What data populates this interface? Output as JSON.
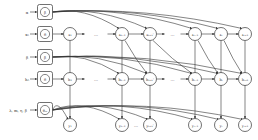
{
  "diagram": {
    "type": "graphical-model",
    "colors": {
      "stroke": "#333333",
      "background": "#ffffff",
      "text": "#333333"
    },
    "inputs": [
      {
        "id": "alpha",
        "label": "α",
        "node_label": "β",
        "y": 12
      },
      {
        "id": "x0",
        "label": "x₀",
        "node_label": "δ",
        "y": 34
      },
      {
        "id": "beta",
        "label": "β",
        "node_label": "β",
        "y": 57
      },
      {
        "id": "h0",
        "label": "h₀",
        "node_label": "δ",
        "y": 79
      },
      {
        "id": "theta",
        "label": "λ, m, η, β",
        "node_label": "θₘ",
        "y": 110
      }
    ],
    "row_x": {
      "y": 34,
      "nodes": [
        "x₁",
        "xₖ₋₁",
        "xₖ₊ₖ'",
        "xₜ₋₁",
        "xₜ",
        "xₜ₊₁"
      ],
      "ellipses": "…"
    },
    "row_h": {
      "y": 79,
      "nodes": [
        "h₁",
        "hₖ₋₁",
        "hₖ₊ₖ'",
        "hₜ₋₁",
        "hₜ",
        "hₜ₊₁"
      ],
      "ellipses": "…"
    },
    "row_y": {
      "y": 125,
      "nodes": [
        "y₁",
        "yₖ₋₁",
        "yₖ₊ₖ'",
        "yₜ₋₁",
        "yₜ",
        "yₜ₊₁"
      ],
      "ellipses": "…"
    }
  }
}
